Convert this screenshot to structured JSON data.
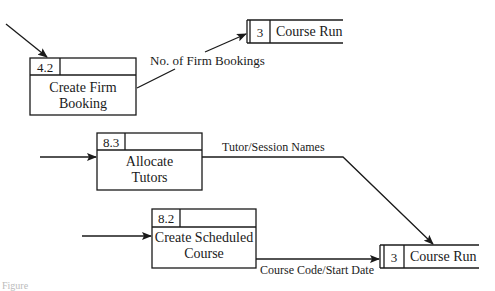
{
  "diagram": {
    "type": "data-flow-diagram",
    "processes": [
      {
        "id": "4.2",
        "title_line1": "Create Firm",
        "title_line2": "Booking"
      },
      {
        "id": "8.3",
        "title_line1": "Allocate",
        "title_line2": "Tutors"
      },
      {
        "id": "8.2",
        "title_line1": "Create Scheduled",
        "title_line2": "Course"
      }
    ],
    "stores": [
      {
        "id": "3",
        "name": "Course Run"
      },
      {
        "id": "3",
        "name": "Course Run"
      }
    ],
    "flows": [
      {
        "from": "external",
        "to": "4.2",
        "label": ""
      },
      {
        "from": "4.2",
        "to": "store-3-top",
        "label": "No. of Firm Bookings"
      },
      {
        "from": "external",
        "to": "8.3",
        "label": ""
      },
      {
        "from": "8.3",
        "to": "store-3-bottom",
        "label": "Tutor/Session Names"
      },
      {
        "from": "external",
        "to": "8.2",
        "label": ""
      },
      {
        "from": "8.2",
        "to": "store-3-bottom",
        "label": "Course Code/Start Date"
      }
    ],
    "caption": "Figure"
  }
}
